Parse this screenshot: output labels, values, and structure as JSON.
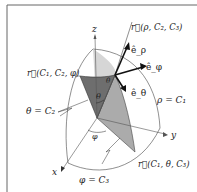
{
  "diagram": {
    "type": "spherical-coordinates-surfaces",
    "axes": {
      "z": "z",
      "x": "x",
      "y": "y"
    },
    "angles": {
      "theta": "θ",
      "phi": "φ"
    },
    "vectors": {
      "r_rho": "r⃗(ρ, C₂, C₃)",
      "r_phi": "r⃗(C₁, C₂, φ)",
      "r_theta": "r⃗(C₁, θ, C₃)"
    },
    "unit_vectors": {
      "e_rho": "ê_ρ",
      "e_phi": "ê_φ",
      "e_theta": "ê_θ"
    },
    "surfaces": {
      "rho": "ρ = C₁",
      "theta": "θ = C₂",
      "phi": "φ = C₃"
    },
    "colors": {
      "frame": "#666666",
      "dark_face": "#6e6e6e",
      "mid_face": "#a8a8a8",
      "light_face": "#d4d4d4",
      "line": "#333333"
    }
  }
}
